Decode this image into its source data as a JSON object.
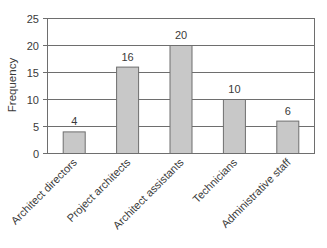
{
  "chart_data": {
    "type": "bar",
    "title": "",
    "xlabel": "",
    "ylabel": "Frequency",
    "categories": [
      "Architect directors",
      "Project architects",
      "Architect assistants",
      "Technicians",
      "Administrative staff"
    ],
    "values": [
      4,
      16,
      20,
      10,
      6
    ],
    "data_labels": [
      "4",
      "16",
      "20",
      "10",
      "6"
    ],
    "ylim": [
      0,
      25
    ],
    "yticks": [
      0,
      5,
      10,
      15,
      20,
      25
    ],
    "ytick_labels": [
      "0",
      "5",
      "10",
      "15",
      "20",
      "25"
    ],
    "grid": "horizontal",
    "legend": "none",
    "colors": {
      "bar_fill": "#c8c8c8",
      "bar_edge": "#6e6e6e",
      "grid": "#6e6e6e",
      "text": "#3a3a3a"
    }
  }
}
